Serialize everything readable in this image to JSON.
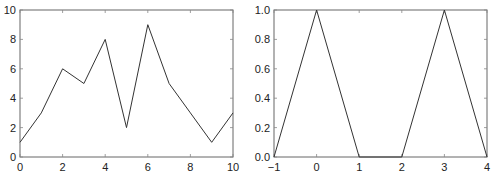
{
  "chart_data": [
    {
      "type": "line",
      "title": "",
      "xlabel": "",
      "ylabel": "",
      "xlim": [
        0,
        10
      ],
      "ylim": [
        0,
        10
      ],
      "grid": false,
      "legend": null,
      "xticks": [
        0,
        2,
        4,
        6,
        8,
        10
      ],
      "yticks": [
        0,
        2,
        4,
        6,
        8,
        10
      ],
      "xtick_labels": [
        "0",
        "2",
        "4",
        "6",
        "8",
        "10"
      ],
      "ytick_labels": [
        "0",
        "2",
        "4",
        "6",
        "8",
        "10"
      ],
      "series": [
        {
          "name": "series1",
          "color": "#333333",
          "x": [
            0,
            1,
            2,
            3,
            4,
            5,
            6,
            7,
            8,
            9,
            10
          ],
          "y": [
            1,
            3,
            6,
            5,
            8,
            2,
            9,
            5,
            3,
            1,
            3
          ]
        }
      ]
    },
    {
      "type": "line",
      "title": "",
      "xlabel": "",
      "ylabel": "",
      "xlim": [
        -1,
        4
      ],
      "ylim": [
        0,
        1
      ],
      "grid": false,
      "legend": null,
      "xticks": [
        -1,
        0,
        1,
        2,
        3,
        4
      ],
      "yticks": [
        0,
        0.2,
        0.4,
        0.6,
        0.8,
        1.0
      ],
      "xtick_labels": [
        "−1",
        "0",
        "1",
        "2",
        "3",
        "4"
      ],
      "ytick_labels": [
        "0.0",
        "0.2",
        "0.4",
        "0.6",
        "0.8",
        "1.0"
      ],
      "series": [
        {
          "name": "series1",
          "color": "#333333",
          "x": [
            -1,
            0,
            1,
            2,
            3,
            4
          ],
          "y": [
            0,
            1,
            0,
            0,
            1,
            0
          ]
        }
      ]
    }
  ],
  "layout": {
    "panels": [
      {
        "plot": {
          "left": 20,
          "top": 10,
          "right": 233,
          "bottom": 157
        }
      },
      {
        "plot": {
          "left": 27,
          "top": 10,
          "right": 240,
          "bottom": 157
        }
      }
    ]
  }
}
